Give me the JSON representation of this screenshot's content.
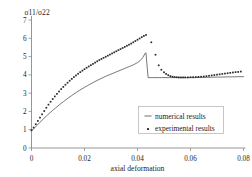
{
  "chart_data": {
    "type": "line",
    "title": "",
    "subtitle": "",
    "xlabel": "axial deformation",
    "ylabel": "σ11/σ22",
    "xlim": [
      0,
      0.08
    ],
    "ylim": [
      0,
      7
    ],
    "xticks": [
      0,
      0.02,
      0.04,
      0.06,
      0.08
    ],
    "xticklabels": [
      "0",
      "0.02",
      "0.04",
      "0.06",
      "0.08"
    ],
    "yticks": [
      0,
      1,
      2,
      3,
      4,
      5,
      6,
      7
    ],
    "yticklabels": [
      "0",
      "1",
      "2",
      "3",
      "4",
      "5",
      "6",
      "7"
    ],
    "grid": false,
    "legend_position": "lower right",
    "series": [
      {
        "name": "numerical results",
        "style": "solid-line",
        "color": "#5f5f5f",
        "x": [
          0.0,
          0.001,
          0.002,
          0.003,
          0.004,
          0.005,
          0.006,
          0.007,
          0.008,
          0.009,
          0.01,
          0.011,
          0.012,
          0.013,
          0.014,
          0.015,
          0.016,
          0.017,
          0.018,
          0.019,
          0.02,
          0.021,
          0.022,
          0.023,
          0.024,
          0.025,
          0.026,
          0.027,
          0.028,
          0.029,
          0.03,
          0.031,
          0.032,
          0.033,
          0.034,
          0.035,
          0.036,
          0.037,
          0.038,
          0.039,
          0.04,
          0.041,
          0.042,
          0.0428,
          0.043,
          0.0432,
          0.044,
          0.045,
          0.046,
          0.047,
          0.048,
          0.049,
          0.05,
          0.052,
          0.054,
          0.056,
          0.058,
          0.06,
          0.062,
          0.064,
          0.066,
          0.068,
          0.07,
          0.072,
          0.074,
          0.076,
          0.078,
          0.08
        ],
        "y": [
          0.92,
          1.08,
          1.23,
          1.38,
          1.52,
          1.66,
          1.8,
          1.93,
          2.06,
          2.18,
          2.3,
          2.42,
          2.53,
          2.64,
          2.75,
          2.85,
          2.95,
          3.05,
          3.14,
          3.23,
          3.32,
          3.4,
          3.48,
          3.56,
          3.64,
          3.71,
          3.78,
          3.85,
          3.92,
          3.98,
          4.04,
          4.1,
          4.16,
          4.22,
          4.28,
          4.34,
          4.4,
          4.46,
          4.52,
          4.59,
          4.67,
          4.78,
          4.95,
          5.16,
          5.2,
          5.2,
          3.85,
          3.85,
          3.85,
          3.85,
          3.85,
          3.85,
          3.85,
          3.85,
          3.85,
          3.85,
          3.85,
          3.85,
          3.85,
          3.86,
          3.86,
          3.87,
          3.88,
          3.88,
          3.89,
          3.89,
          3.9,
          3.9
        ]
      },
      {
        "name": "experimental results",
        "style": "dotted-markers",
        "color": "#2a2a2a",
        "x": [
          0.0,
          0.0008,
          0.0016,
          0.0024,
          0.0032,
          0.004,
          0.0048,
          0.0056,
          0.0064,
          0.0072,
          0.008,
          0.0088,
          0.0096,
          0.0104,
          0.0112,
          0.012,
          0.0128,
          0.0136,
          0.0144,
          0.0152,
          0.016,
          0.0168,
          0.0176,
          0.0184,
          0.0192,
          0.02,
          0.0208,
          0.0216,
          0.0224,
          0.0232,
          0.024,
          0.0248,
          0.0256,
          0.0264,
          0.0272,
          0.028,
          0.0288,
          0.0296,
          0.0304,
          0.0312,
          0.032,
          0.0328,
          0.0336,
          0.0344,
          0.0352,
          0.036,
          0.0368,
          0.0376,
          0.0384,
          0.0392,
          0.04,
          0.0408,
          0.0416,
          0.0424,
          0.0432,
          0.0452,
          0.0468,
          0.048,
          0.049,
          0.05,
          0.0508,
          0.0516,
          0.0524,
          0.0532,
          0.054,
          0.0548,
          0.0556,
          0.0564,
          0.0572,
          0.058,
          0.059,
          0.06,
          0.061,
          0.062,
          0.063,
          0.064,
          0.065,
          0.066,
          0.067,
          0.068,
          0.069,
          0.07,
          0.071,
          0.072,
          0.073,
          0.074,
          0.075,
          0.076,
          0.077,
          0.078,
          0.079
        ],
        "y": [
          0.98,
          1.12,
          1.3,
          1.48,
          1.66,
          1.84,
          2.02,
          2.2,
          2.37,
          2.53,
          2.68,
          2.82,
          2.96,
          3.09,
          3.22,
          3.34,
          3.46,
          3.57,
          3.68,
          3.78,
          3.88,
          3.97,
          4.06,
          4.15,
          4.23,
          4.31,
          4.39,
          4.46,
          4.53,
          4.6,
          4.67,
          4.74,
          4.81,
          4.87,
          4.93,
          4.99,
          5.05,
          5.11,
          5.17,
          5.23,
          5.29,
          5.35,
          5.41,
          5.47,
          5.53,
          5.59,
          5.65,
          5.71,
          5.78,
          5.85,
          5.92,
          5.99,
          6.06,
          6.13,
          6.18,
          5.78,
          5.1,
          4.52,
          4.28,
          4.14,
          4.05,
          3.98,
          3.93,
          3.9,
          3.88,
          3.87,
          3.86,
          3.86,
          3.86,
          3.86,
          3.86,
          3.87,
          3.87,
          3.88,
          3.89,
          3.9,
          3.91,
          3.93,
          3.95,
          3.97,
          3.99,
          4.01,
          4.03,
          4.05,
          4.07,
          4.09,
          4.11,
          4.13,
          4.15,
          4.16,
          4.18
        ]
      }
    ],
    "legend": [
      {
        "label": "numerical results",
        "marker": "line"
      },
      {
        "label": "experimental results",
        "marker": "dot"
      }
    ]
  }
}
